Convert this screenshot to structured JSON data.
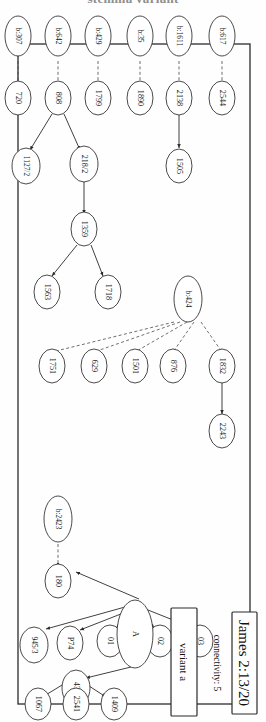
{
  "figure": {
    "title_clipped": "stemma variant",
    "passage_label": "James 2:13/20",
    "connectivity_label": "connectivity: 5",
    "variant_label": "variant a",
    "ink_color": "#2b2b2b",
    "background": "#fefefe"
  },
  "witnesses": {
    "external": [
      {
        "id": "w-b617",
        "label": "b:617"
      },
      {
        "id": "w-b1611",
        "label": "b:1611"
      },
      {
        "id": "w-b35",
        "label": "b:35"
      },
      {
        "id": "w-b429",
        "label": "b:429"
      },
      {
        "id": "w-b642",
        "label": "b:642"
      },
      {
        "id": "w-b307",
        "label": "b:307"
      },
      {
        "id": "w-b424",
        "label": "b:424"
      },
      {
        "id": "w-b2423",
        "label": "b:2423"
      }
    ],
    "internal": [
      {
        "id": "n-2544",
        "label": "2544"
      },
      {
        "id": "n-2138",
        "label": "2138"
      },
      {
        "id": "n-1505",
        "label": "1505"
      },
      {
        "id": "n-1890",
        "label": "1890"
      },
      {
        "id": "n-1799",
        "label": "1799"
      },
      {
        "id": "n-808",
        "label": "808"
      },
      {
        "id": "n-218-2",
        "label": "218/2"
      },
      {
        "id": "n-1127-2",
        "label": "1127/2"
      },
      {
        "id": "n-1359",
        "label": "1359"
      },
      {
        "id": "n-1718",
        "label": "1718"
      },
      {
        "id": "n-1563",
        "label": "1563"
      },
      {
        "id": "n-720",
        "label": "720"
      },
      {
        "id": "n-1832",
        "label": "1832"
      },
      {
        "id": "n-2243",
        "label": "2243"
      },
      {
        "id": "n-876",
        "label": "876"
      },
      {
        "id": "n-1501",
        "label": "1501"
      },
      {
        "id": "n-629",
        "label": "629"
      },
      {
        "id": "n-1751",
        "label": "1751"
      },
      {
        "id": "n-180",
        "label": "180"
      },
      {
        "id": "n-03",
        "label": "03"
      },
      {
        "id": "n-02",
        "label": "02"
      },
      {
        "id": "n-01",
        "label": "01"
      },
      {
        "id": "n-P74",
        "label": "P74"
      },
      {
        "id": "n-A",
        "label": "A"
      },
      {
        "id": "n-945-3",
        "label": "945/3"
      },
      {
        "id": "n-436",
        "label": "436"
      },
      {
        "id": "n-1067",
        "label": "1067"
      },
      {
        "id": "n-2541",
        "label": "2541"
      },
      {
        "id": "n-1409",
        "label": "1409"
      }
    ]
  },
  "edges": {
    "solid": [
      {
        "from": "2138",
        "to": "1505"
      },
      {
        "from": "808",
        "to": "218/2"
      },
      {
        "from": "808",
        "to": "1127/2"
      },
      {
        "from": "218/2",
        "to": "1359"
      },
      {
        "from": "1359",
        "to": "1718"
      },
      {
        "from": "1359",
        "to": "1563"
      },
      {
        "from": "1832",
        "to": "2243"
      },
      {
        "from": "A",
        "to": "180"
      },
      {
        "from": "A",
        "to": "01"
      },
      {
        "from": "A",
        "to": "02"
      },
      {
        "from": "A",
        "to": "03"
      },
      {
        "from": "A",
        "to": "P74"
      },
      {
        "from": "A",
        "to": "945/3"
      },
      {
        "from": "A",
        "to": "436"
      },
      {
        "from": "436",
        "to": "1067"
      },
      {
        "from": "436",
        "to": "2541"
      },
      {
        "from": "436",
        "to": "1409"
      }
    ],
    "dashed": [
      {
        "from": "b:617",
        "to": "2544"
      },
      {
        "from": "b:1611",
        "to": "2138"
      },
      {
        "from": "b:35",
        "to": "1890"
      },
      {
        "from": "b:429",
        "to": "1799"
      },
      {
        "from": "b:642",
        "to": "808"
      },
      {
        "from": "b:307",
        "to": "720"
      },
      {
        "from": "b:424",
        "to": "1832"
      },
      {
        "from": "b:424",
        "to": "876"
      },
      {
        "from": "b:424",
        "to": "1501"
      },
      {
        "from": "b:424",
        "to": "629"
      },
      {
        "from": "b:424",
        "to": "1751"
      },
      {
        "from": "b:2423",
        "to": "180"
      }
    ]
  }
}
